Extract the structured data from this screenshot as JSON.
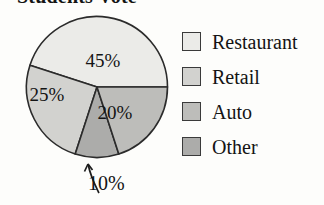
{
  "title": "Students Vote",
  "background_color": "#fdfdfb",
  "chart_data": {
    "type": "pie",
    "title": "Students Vote",
    "categories": [
      "Restaurant",
      "Retail",
      "Auto",
      "Other"
    ],
    "values": [
      45,
      25,
      20,
      10
    ],
    "value_labels": [
      "45%",
      "25%",
      "20%",
      "10%"
    ],
    "unit": "percent",
    "colors": [
      "#ebebe8",
      "#d2d2cf",
      "#bdbdba",
      "#acacaa"
    ],
    "legend_position": "right",
    "grid": false,
    "annotations": [
      {
        "text": "10%",
        "target_slice": "Other",
        "style": "curved-leader-arrow",
        "placement": "below-pie"
      }
    ],
    "slice_order_note": "Starts at 3 o'clock and proceeds counter-clockwise: Restaurant 45%, Retail 25%, Other 10%, Auto 20%"
  },
  "pie": {
    "slices": [
      {
        "name": "Restaurant",
        "label": "45%",
        "value": 45,
        "color": "#ebebe8",
        "label_x": 78,
        "label_y": 52
      },
      {
        "name": "Retail",
        "label": "25%",
        "value": 25,
        "color": "#d2d2cf",
        "label_x": 22,
        "label_y": 86
      },
      {
        "name": "Other",
        "label": "10%",
        "value": 10,
        "color": "#acacaa",
        "label_x": 0,
        "label_y": 0
      },
      {
        "name": "Auto",
        "label": "20%",
        "value": 20,
        "color": "#bdbdba",
        "label_x": 90,
        "label_y": 104
      }
    ],
    "stroke_color": "#2b2b2b"
  },
  "callout": {
    "label": "10%"
  },
  "legend": {
    "items": [
      {
        "label": "Restaurant",
        "color": "#ebebe8"
      },
      {
        "label": "Retail",
        "color": "#d2d2cf"
      },
      {
        "label": "Auto",
        "color": "#bdbdba"
      },
      {
        "label": "Other",
        "color": "#acacaa"
      }
    ]
  }
}
